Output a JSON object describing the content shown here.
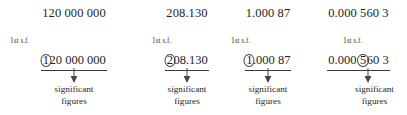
{
  "figure": {
    "background_color": "#ffffff",
    "text_color": "#231f20",
    "rule_color": "#3b3637",
    "columns": [
      {
        "top_number": "120 000 000",
        "sf_label": "1st s.f.",
        "marked_number": {
          "circled_digit": "1",
          "rest": "20 000 000",
          "full": "120 000 000"
        },
        "arrow_label_line1": "significant",
        "arrow_label_line2": "figures"
      },
      {
        "top_number": "208.130",
        "sf_label": "1st s.f.",
        "marked_number": {
          "circled_digit": "2",
          "rest": "08.130",
          "full": "208.130"
        },
        "arrow_label_line1": "significant",
        "arrow_label_line2": "figures"
      },
      {
        "top_number": "1.000 87",
        "sf_label": "1st s.f.",
        "marked_number": {
          "circled_digit": "1",
          "rest": ".000 87",
          "full": "1.000 87"
        },
        "arrow_label_line1": "significant",
        "arrow_label_line2": "figures"
      },
      {
        "top_number": "0.000 560 3",
        "sf_label": "1st s.f.",
        "marked_number": {
          "prefix": "0.000 ",
          "circled_digit": "5",
          "rest": "60 3",
          "full": "0.000 560 3"
        },
        "arrow_label_line1": "significant",
        "arrow_label_line2": "figures"
      }
    ]
  }
}
